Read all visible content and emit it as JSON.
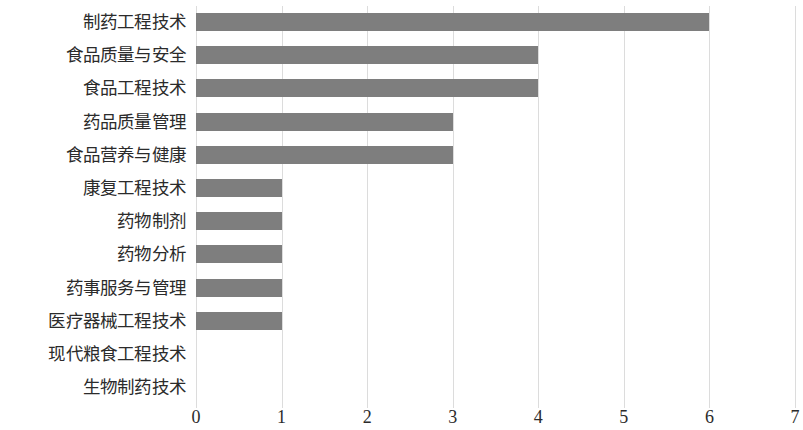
{
  "chart_data": {
    "type": "bar",
    "orientation": "horizontal",
    "title": "",
    "subtitle": "",
    "xlabel": "",
    "ylabel": "",
    "xlim": [
      0,
      7
    ],
    "grid": true,
    "legend": false,
    "legend_position": "none",
    "bar_color": "#7e7e7e",
    "gridline_color": "#dcdcdc",
    "text_color": "#2b2b2b",
    "background_color": "#ffffff",
    "xticks": [
      "0",
      "1",
      "2",
      "3",
      "4",
      "5",
      "6",
      "7"
    ],
    "xtick_values": [
      0,
      1,
      2,
      3,
      4,
      5,
      6,
      7
    ],
    "categories": [
      "制药工程技术",
      "食品质量与安全",
      "食品工程技术",
      "药品质量管理",
      "食品营养与健康",
      "康复工程技术",
      "药物制剂",
      "药物分析",
      "药事服务与管理",
      "医疗器械工程技术",
      "现代粮食工程技术",
      "生物制药技术"
    ],
    "values": [
      6,
      4,
      4,
      3,
      3,
      1,
      1,
      1,
      1,
      1,
      0,
      0
    ]
  }
}
